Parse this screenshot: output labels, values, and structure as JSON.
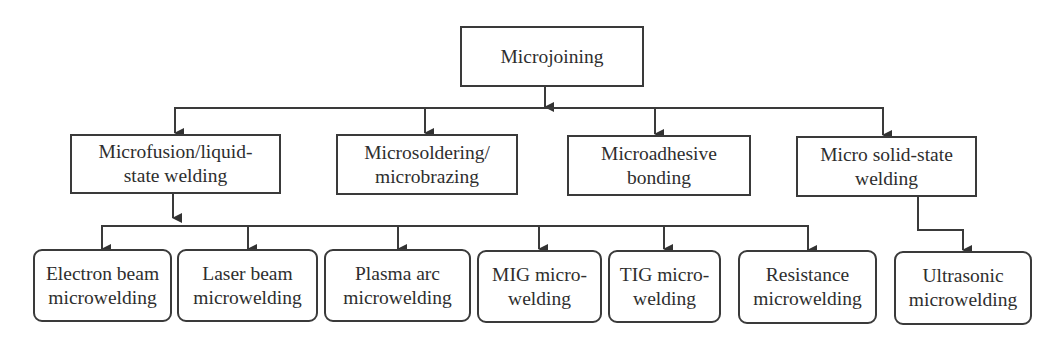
{
  "diagram": {
    "root": {
      "label": "Microjoining"
    },
    "categories": [
      {
        "id": "microfusion",
        "label": "Microfusion/liquid-\nstate welding"
      },
      {
        "id": "microsoldering",
        "label": "Microsoldering/\nmicrobrazing"
      },
      {
        "id": "microadhesive",
        "label": "Microadhesive\nbonding"
      },
      {
        "id": "solid-state",
        "label": "Micro solid-state\nwelding"
      }
    ],
    "processes": [
      {
        "id": "electron-beam",
        "parent": "microfusion",
        "label": "Electron beam\nmicrowelding"
      },
      {
        "id": "laser-beam",
        "parent": "microfusion",
        "label": "Laser beam\nmicrowelding"
      },
      {
        "id": "plasma-arc",
        "parent": "microfusion",
        "label": "Plasma arc\nmicrowelding"
      },
      {
        "id": "mig",
        "parent": "microfusion",
        "label": "MIG micro-\nwelding"
      },
      {
        "id": "tig",
        "parent": "microfusion",
        "label": "TIG micro-\nwelding"
      },
      {
        "id": "resistance",
        "parent": "microfusion",
        "label": "Resistance\nmicrowelding"
      },
      {
        "id": "ultrasonic",
        "parent": "solid-state",
        "label": "Ultrasonic\nmicrowelding"
      }
    ],
    "colors": {
      "line": "#3a3a3a",
      "text": "#2e2e2e",
      "background": "#ffffff"
    }
  }
}
